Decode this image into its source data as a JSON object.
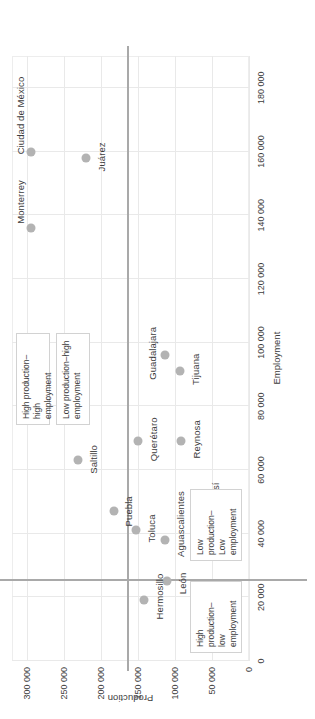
{
  "chart_data": {
    "type": "scatter",
    "title": "",
    "xlabel": "Employment",
    "ylabel": "Production",
    "xlim": [
      0,
      190000
    ],
    "ylim": [
      0,
      320000
    ],
    "grid": true,
    "legend": "none",
    "orientation": "rotated-90-ccw",
    "xticks": [
      "0",
      "20 000",
      "40 000",
      "60 000",
      "80 000",
      "100 000",
      "120 000",
      "140 000",
      "160 000",
      "180 000"
    ],
    "xtick_values": [
      0,
      20000,
      40000,
      60000,
      80000,
      100000,
      120000,
      140000,
      160000,
      180000
    ],
    "yticks": [
      "0",
      "50 000",
      "100 000",
      "150 000",
      "200 000",
      "250 000",
      "300 000"
    ],
    "ytick_values": [
      0,
      50000,
      100000,
      150000,
      200000,
      250000,
      300000
    ],
    "point_color": "#b3b3b3",
    "divider_color": "#a9a9a9",
    "grid_color": "#e9e9e9",
    "quadrant_divider_x": 25000,
    "quadrant_divider_y": 165000,
    "points": [
      {
        "label": "Ciudad de México",
        "x": 160000,
        "y": 295000
      },
      {
        "label": "Monterrey",
        "x": 136000,
        "y": 295000
      },
      {
        "label": "Juárez",
        "x": 158000,
        "y": 220000
      },
      {
        "label": "Saltillo",
        "x": 63000,
        "y": 231000
      },
      {
        "label": "Puebla",
        "x": 47000,
        "y": 182000
      },
      {
        "label": "Toluca",
        "x": 41000,
        "y": 152000
      },
      {
        "label": "Hermosillo",
        "x": 19000,
        "y": 142000
      },
      {
        "label": "Aguascalientes",
        "x": 38000,
        "y": 113000
      },
      {
        "label": "León",
        "x": 25000,
        "y": 111000
      },
      {
        "label": "Guadalajara",
        "x": 96000,
        "y": 113000
      },
      {
        "label": "Tijuana",
        "x": 91000,
        "y": 93000
      },
      {
        "label": "Querétaro",
        "x": 69000,
        "y": 150000
      },
      {
        "label": "Reynosa",
        "x": 69000,
        "y": 92000
      },
      {
        "label": "San Luis Potosí",
        "x": 41000,
        "y": 66000
      }
    ],
    "annotations": [
      {
        "id": "high-prod-high-emp",
        "text": "High production–high\nemployment"
      },
      {
        "id": "low-prod-high-emp",
        "text": "Low production–high\nemployment"
      },
      {
        "id": "high-prod-low-emp",
        "text": "High\nproduction–\nlow\nemployment"
      },
      {
        "id": "low-prod-low-emp",
        "text": "Low\nproduction–\nLow\nemployment"
      }
    ]
  }
}
